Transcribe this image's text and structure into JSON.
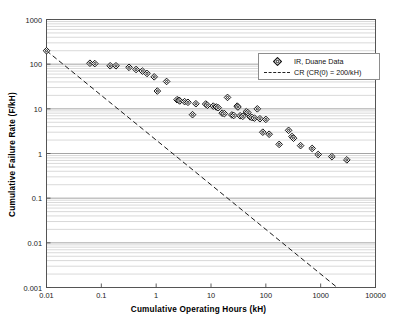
{
  "chart_data": {
    "type": "scatter",
    "title": "",
    "xlabel": "Cumulative Operating Hours (kH)",
    "ylabel": "Cumulative Failure Rate (F/kH)",
    "xscale": "log",
    "yscale": "log",
    "xlim": [
      0.01,
      10000
    ],
    "ylim": [
      0.001,
      1000
    ],
    "xticks": [
      "0.01",
      "0.1",
      "1",
      "10",
      "100",
      "1000",
      "10000"
    ],
    "yticks": [
      "0.001",
      "0.01",
      "0.1",
      "1",
      "10",
      "100",
      "1000"
    ],
    "grid": "horizontal-major-and-minor",
    "legend_position": "upper-right-inside",
    "series": [
      {
        "name": "IR, Duane Data",
        "type": "scatter",
        "marker": "diamond-open",
        "points": [
          [
            0.01,
            200.0
          ],
          [
            0.062,
            105.0
          ],
          [
            0.076,
            103.0
          ],
          [
            0.145,
            92.0
          ],
          [
            0.185,
            92.0
          ],
          [
            0.32,
            85.0
          ],
          [
            0.43,
            76.0
          ],
          [
            0.56,
            70.0
          ],
          [
            0.68,
            62.0
          ],
          [
            0.92,
            52.0
          ],
          [
            1.05,
            25.0
          ],
          [
            1.55,
            41.0
          ],
          [
            2.4,
            16.0
          ],
          [
            2.6,
            15.5
          ],
          [
            2.7,
            15.0
          ],
          [
            3.3,
            14.5
          ],
          [
            3.8,
            14.0
          ],
          [
            4.6,
            7.4
          ],
          [
            5.3,
            13.0
          ],
          [
            8.0,
            12.8
          ],
          [
            8.6,
            12.0
          ],
          [
            11.0,
            11.5
          ],
          [
            12.5,
            11.0
          ],
          [
            13.5,
            10.6
          ],
          [
            16.0,
            8.0
          ],
          [
            17.5,
            7.8
          ],
          [
            20.0,
            18.0
          ],
          [
            24.0,
            7.3
          ],
          [
            26.0,
            7.1
          ],
          [
            30.0,
            11.5
          ],
          [
            31.0,
            11.0
          ],
          [
            34.0,
            7.0
          ],
          [
            38.0,
            6.8
          ],
          [
            44.0,
            8.6
          ],
          [
            47.0,
            8.2
          ],
          [
            52.0,
            6.6
          ],
          [
            56.0,
            6.4
          ],
          [
            62.0,
            6.2
          ],
          [
            70.0,
            10.0
          ],
          [
            78.0,
            6.0
          ],
          [
            88.0,
            3.0
          ],
          [
            100.0,
            5.8
          ],
          [
            115.0,
            2.7
          ],
          [
            175.0,
            1.6
          ],
          [
            260.0,
            3.3
          ],
          [
            300.0,
            2.4
          ],
          [
            320.0,
            2.2
          ],
          [
            430.0,
            1.5
          ],
          [
            700.0,
            1.3
          ],
          [
            900.0,
            0.95
          ],
          [
            1600.0,
            0.85
          ],
          [
            3000.0,
            0.72
          ]
        ]
      },
      {
        "name": "CR (CR(0) = 200/kH)",
        "type": "line",
        "style": "dashed",
        "points": [
          [
            0.01,
            200.0
          ],
          [
            2000.0,
            0.001
          ]
        ]
      }
    ]
  },
  "legend": {
    "items": [
      {
        "label": "IR, Duane Data",
        "key": "diamond-marker"
      },
      {
        "label": "CR (CR(0) = 200/kH)",
        "key": "dashed-line"
      }
    ]
  },
  "axes": {
    "x_title": "Cumulative Operating Hours (kH)",
    "y_title": "Cumulative Failure Rate (F/kH)",
    "x_tick_labels": [
      "0.01",
      "0.1",
      "1",
      "10",
      "100",
      "1000",
      "10000"
    ],
    "y_tick_labels": [
      "1000",
      "100",
      "10",
      "1",
      "0.1",
      "0.01",
      "0.001"
    ]
  },
  "colors": {
    "axis": "#4d4d4d",
    "grid_major": "#9b9b9b",
    "grid_minor": "#c9c9c9",
    "marker": "#111111",
    "trend_line": "#1a1a1a"
  }
}
